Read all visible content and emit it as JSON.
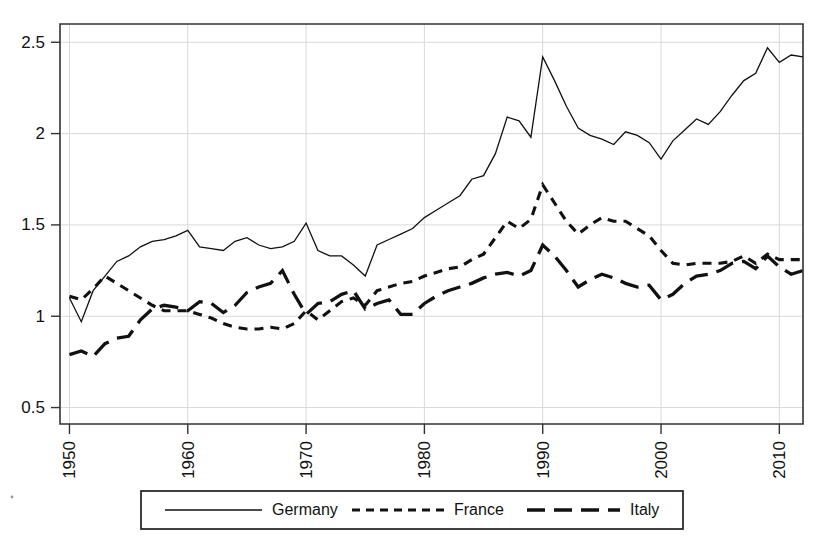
{
  "chart_data": {
    "type": "line",
    "title": "",
    "subtitle": "",
    "xlabel": "",
    "ylabel": "",
    "xlim": [
      1949.2,
      2012.0
    ],
    "ylim": [
      0.41,
      2.6
    ],
    "grid": true,
    "legend_position": "bottom",
    "xticks": [
      "1950",
      "1960",
      "1970",
      "1980",
      "1990",
      "2000",
      "2010"
    ],
    "xtick_values": [
      1950,
      1960,
      1970,
      1980,
      1990,
      2000,
      2010
    ],
    "yticks": [
      "0.5",
      "1",
      "1.5",
      "2",
      "2.5"
    ],
    "ytick_values": [
      0.5,
      1,
      1.5,
      2,
      2.5
    ],
    "x": [
      1950,
      1951,
      1952,
      1953,
      1954,
      1955,
      1956,
      1957,
      1958,
      1959,
      1960,
      1961,
      1962,
      1963,
      1964,
      1965,
      1966,
      1967,
      1968,
      1969,
      1970,
      1971,
      1972,
      1973,
      1974,
      1975,
      1976,
      1977,
      1978,
      1979,
      1980,
      1981,
      1982,
      1983,
      1984,
      1985,
      1986,
      1987,
      1988,
      1989,
      1990,
      1991,
      1992,
      1993,
      1994,
      1995,
      1996,
      1997,
      1998,
      1999,
      2000,
      2001,
      2002,
      2003,
      2004,
      2005,
      2006,
      2007,
      2008,
      2009,
      2010,
      2011,
      2012
    ],
    "series": [
      {
        "name": "Germany",
        "style": "solid",
        "color": "#111111",
        "values": [
          1.1,
          0.97,
          1.14,
          1.22,
          1.3,
          1.33,
          1.38,
          1.41,
          1.42,
          1.44,
          1.47,
          1.38,
          1.37,
          1.36,
          1.41,
          1.43,
          1.39,
          1.37,
          1.38,
          1.41,
          1.51,
          1.36,
          1.33,
          1.33,
          1.28,
          1.22,
          1.39,
          1.42,
          1.45,
          1.48,
          1.54,
          1.58,
          1.62,
          1.66,
          1.75,
          1.77,
          1.89,
          2.09,
          2.07,
          1.98,
          2.42,
          2.29,
          2.15,
          2.03,
          1.99,
          1.97,
          1.94,
          2.01,
          1.99,
          1.95,
          1.86,
          1.96,
          2.02,
          2.08,
          2.05,
          2.12,
          2.21,
          2.29,
          2.33,
          2.47,
          2.39,
          2.43,
          2.42
        ]
      },
      {
        "name": "France",
        "style": "short-dash",
        "color": "#111111",
        "values": [
          1.11,
          1.09,
          1.15,
          1.22,
          1.18,
          1.14,
          1.1,
          1.06,
          1.03,
          1.03,
          1.03,
          1.01,
          0.99,
          0.96,
          0.94,
          0.93,
          0.93,
          0.94,
          0.93,
          0.96,
          1.03,
          0.98,
          1.03,
          1.08,
          1.1,
          1.06,
          1.14,
          1.16,
          1.18,
          1.19,
          1.22,
          1.24,
          1.26,
          1.27,
          1.31,
          1.34,
          1.43,
          1.52,
          1.48,
          1.53,
          1.72,
          1.62,
          1.52,
          1.45,
          1.5,
          1.54,
          1.52,
          1.52,
          1.48,
          1.44,
          1.36,
          1.29,
          1.28,
          1.29,
          1.29,
          1.29,
          1.3,
          1.33,
          1.29,
          1.34,
          1.31,
          1.31,
          1.31
        ]
      },
      {
        "name": "Italy",
        "style": "long-dash",
        "color": "#111111",
        "values": [
          0.79,
          0.81,
          0.78,
          0.85,
          0.88,
          0.89,
          0.98,
          1.04,
          1.06,
          1.05,
          1.03,
          1.08,
          1.07,
          1.02,
          1.06,
          1.13,
          1.16,
          1.18,
          1.25,
          1.12,
          1.01,
          1.07,
          1.08,
          1.12,
          1.14,
          1.04,
          1.07,
          1.09,
          1.01,
          1.01,
          1.07,
          1.11,
          1.14,
          1.16,
          1.18,
          1.21,
          1.23,
          1.24,
          1.22,
          1.25,
          1.39,
          1.33,
          1.25,
          1.16,
          1.2,
          1.23,
          1.21,
          1.18,
          1.16,
          1.17,
          1.09,
          1.12,
          1.18,
          1.22,
          1.23,
          1.25,
          1.29,
          1.3,
          1.26,
          1.33,
          1.27,
          1.23,
          1.25
        ]
      }
    ],
    "legend": [
      {
        "label": "Germany",
        "style": "solid"
      },
      {
        "label": "France",
        "style": "short-dash"
      },
      {
        "label": "Italy",
        "style": "long-dash"
      }
    ]
  }
}
